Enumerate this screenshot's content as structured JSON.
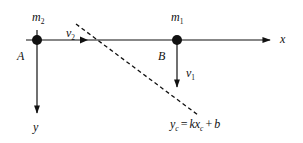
{
  "diagram": {
    "type": "kinematics-coordinate-diagram",
    "axes": {
      "x_label": "x",
      "y_label": "y"
    },
    "points": [
      {
        "id": "A",
        "label": "A",
        "mass_symbol": "m",
        "mass_subscript": "2"
      },
      {
        "id": "B",
        "label": "B",
        "mass_symbol": "m",
        "mass_subscript": "1"
      }
    ],
    "velocities": [
      {
        "symbol": "v",
        "subscript": "2",
        "direction": "along +x from A"
      },
      {
        "symbol": "v",
        "subscript": "1",
        "direction": "along +y from B"
      }
    ],
    "line": {
      "style": "dashed",
      "equation": {
        "lhs_symbol": "y",
        "lhs_subscript": "c",
        "eq": "=",
        "k": "kx",
        "k_subscript": "c",
        "plus": "+",
        "b": "b"
      }
    },
    "colors": {
      "stroke": "#111111",
      "background": "#ffffff"
    }
  }
}
